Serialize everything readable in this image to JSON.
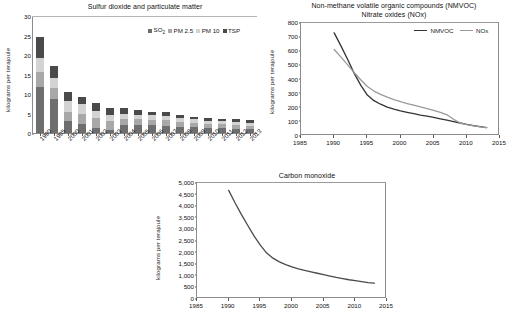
{
  "charts": {
    "so2": {
      "title": "Sulfur dioxide and particulate matter",
      "ylabel": "kilograms per terajoule",
      "legend": [
        {
          "label": "SO",
          "sub": "2",
          "color": "#6e6e6e",
          "key": "SO2"
        },
        {
          "label": "PM 2.5",
          "sub": "",
          "color": "#a8a8a8",
          "key": "PM 2.5"
        },
        {
          "label": "PM 10",
          "sub": "",
          "color": "#d3d3d3",
          "key": "PM 10"
        },
        {
          "label": "TSP",
          "sub": "",
          "color": "#4a4a4a",
          "key": "TSP"
        }
      ],
      "yticks": [
        "0",
        "5",
        "10",
        "15",
        "20",
        "25",
        "30"
      ]
    },
    "nmvoc": {
      "title_line1": "Non-methane volatile organic compounds (NMVOC)",
      "title_line2": "Nitrate oxides (NOx)",
      "ylabel": "kilograms per terajoule",
      "legend": [
        {
          "label": "NMVOC",
          "color": "#333333"
        },
        {
          "label": "NOx",
          "color": "#9a9a9a"
        }
      ],
      "yticks": [
        "0",
        "100",
        "200",
        "300",
        "400",
        "500",
        "600",
        "700",
        "800"
      ],
      "xticks": [
        "1985",
        "1990",
        "1995",
        "2000",
        "2005",
        "2010",
        "2015"
      ]
    },
    "co": {
      "title": "Carbon monoxide",
      "ylabel": "kilograms per terajoule",
      "yticks": [
        "0",
        "500",
        "1,000",
        "1,500",
        "2,000",
        "2,500",
        "3,000",
        "3,500",
        "4,000",
        "4,500",
        "5,000"
      ],
      "xticks": [
        "1985",
        "1990",
        "1995",
        "2000",
        "2005",
        "2010",
        "2015"
      ],
      "line_color": "#4a4a4a"
    }
  },
  "chart_data": [
    {
      "type": "bar",
      "stacked": true,
      "title": "Sulfur dioxide and particulate matter",
      "xlabel": "",
      "ylabel": "kilograms per terajoule",
      "ylim": [
        0,
        30
      ],
      "ytick_step": 5,
      "grid": false,
      "legend_position": "top-right",
      "categories": [
        "1990",
        "1995",
        "2000",
        "2001",
        "2002",
        "2003",
        "2004",
        "2005",
        "2006",
        "2007",
        "2008",
        "2009",
        "2010",
        "2011",
        "2012",
        "2013"
      ],
      "series": [
        {
          "name": "SO2",
          "color": "#6e6e6e",
          "values": [
            11.9,
            8.7,
            3.1,
            2.4,
            1.2,
            0.9,
            2.1,
            2.1,
            2.0,
            1.9,
            1.6,
            1.5,
            1.3,
            1.2,
            1.1,
            1.0
          ]
        },
        {
          "name": "PM 2.5",
          "color": "#a8a8a8",
          "values": [
            3.7,
            2.8,
            2.3,
            2.5,
            2.6,
            2.2,
            1.6,
            1.4,
            1.4,
            1.4,
            1.2,
            1.1,
            1.1,
            1.0,
            1.0,
            0.9
          ]
        },
        {
          "name": "PM 10",
          "color": "#d3d3d3",
          "values": [
            3.6,
            2.7,
            2.9,
            2.6,
            1.9,
            1.6,
            1.3,
            1.2,
            1.1,
            1.1,
            1.0,
            0.9,
            0.8,
            0.8,
            0.7,
            0.7
          ]
        },
        {
          "name": "TSP",
          "color": "#4a4a4a",
          "values": [
            5.4,
            3.1,
            2.3,
            1.8,
            1.9,
            1.7,
            1.4,
            1.3,
            1.0,
            0.9,
            0.9,
            0.7,
            0.7,
            0.7,
            0.7,
            0.7
          ]
        }
      ],
      "totals": [
        24.6,
        17.3,
        10.6,
        9.3,
        7.6,
        6.4,
        6.4,
        6.0,
        5.5,
        5.3,
        4.7,
        4.2,
        3.9,
        3.7,
        3.5,
        3.3
      ]
    },
    {
      "type": "line",
      "title": "Non-methane volatile organic compounds (NMVOC) / Nitrate oxides (NOx)",
      "xlabel": "",
      "ylabel": "kilograms per terajoule",
      "xlim": [
        1985,
        2015
      ],
      "ylim": [
        0,
        800
      ],
      "ytick_step": 100,
      "xticks": [
        1985,
        1990,
        1995,
        2000,
        2005,
        2010,
        2015
      ],
      "grid": false,
      "legend_position": "top-right",
      "series": [
        {
          "name": "NMVOC",
          "color": "#333333",
          "x": [
            1990,
            1991,
            1992,
            1993,
            1994,
            1995,
            1996,
            1997,
            1998,
            1999,
            2000,
            2001,
            2002,
            2003,
            2004,
            2005,
            2006,
            2007,
            2008,
            2009,
            2010,
            2011,
            2012,
            2013
          ],
          "y": [
            730,
            640,
            545,
            445,
            360,
            290,
            250,
            225,
            205,
            190,
            178,
            168,
            158,
            148,
            140,
            132,
            122,
            112,
            102,
            92,
            82,
            74,
            66,
            60
          ]
        },
        {
          "name": "NOx",
          "color": "#9a9a9a",
          "x": [
            1990,
            1991,
            1992,
            1993,
            1994,
            1995,
            1996,
            1997,
            1998,
            1999,
            2000,
            2001,
            2002,
            2003,
            2004,
            2005,
            2006,
            2007,
            2008,
            2009,
            2010,
            2011,
            2012,
            2013
          ],
          "y": [
            612,
            560,
            505,
            450,
            398,
            350,
            318,
            295,
            275,
            258,
            243,
            230,
            218,
            206,
            194,
            182,
            168,
            150,
            118,
            92,
            80,
            72,
            65,
            60
          ]
        }
      ]
    },
    {
      "type": "line",
      "title": "Carbon monoxide",
      "xlabel": "",
      "ylabel": "kilograms per terajoule",
      "xlim": [
        1985,
        2015
      ],
      "ylim": [
        0,
        5000
      ],
      "ytick_step": 500,
      "xticks": [
        1985,
        1990,
        1995,
        2000,
        2005,
        2010,
        2015
      ],
      "grid": false,
      "series": [
        {
          "name": "Carbon monoxide",
          "color": "#4a4a4a",
          "x": [
            1990,
            1991,
            1992,
            1993,
            1994,
            1995,
            1996,
            1997,
            1998,
            1999,
            2000,
            2001,
            2002,
            2003,
            2004,
            2005,
            2006,
            2007,
            2008,
            2009,
            2010,
            2011,
            2012,
            2013
          ],
          "y": [
            4680,
            4150,
            3650,
            3180,
            2720,
            2320,
            1980,
            1760,
            1600,
            1480,
            1380,
            1300,
            1230,
            1170,
            1110,
            1050,
            990,
            930,
            880,
            830,
            790,
            750,
            710,
            680
          ]
        }
      ]
    }
  ]
}
